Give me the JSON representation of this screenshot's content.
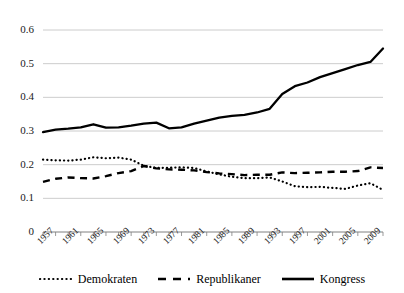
{
  "chart_data": {
    "type": "line",
    "title": "",
    "subtitle": "",
    "xlabel": "",
    "ylabel": "",
    "grid": true,
    "legend_position": "bottom",
    "xlim": [
      1957,
      2011
    ],
    "ylim": [
      0,
      0.6
    ],
    "yticks": [
      "0",
      "0.1",
      "0.2",
      "0.3",
      "0.4",
      "0.5",
      "0.6"
    ],
    "ytick_values": [
      0,
      0.1,
      0.2,
      0.3,
      0.4,
      0.5,
      0.6
    ],
    "xticks": [
      "1957",
      "1961",
      "1965",
      "1969",
      "1973",
      "1977",
      "1981",
      "1985",
      "1989",
      "1993",
      "1997",
      "2001",
      "2005",
      "2009"
    ],
    "x": [
      1957,
      1959,
      1961,
      1963,
      1965,
      1967,
      1969,
      1971,
      1973,
      1975,
      1977,
      1979,
      1981,
      1983,
      1985,
      1987,
      1989,
      1991,
      1993,
      1995,
      1997,
      1999,
      2001,
      2003,
      2005,
      2007,
      2009,
      2011
    ],
    "series": [
      {
        "name": "Demokraten",
        "style": "dotted",
        "color": "#000000",
        "values": [
          0.215,
          0.213,
          0.212,
          0.215,
          0.222,
          0.219,
          0.221,
          0.215,
          0.197,
          0.19,
          0.191,
          0.192,
          0.19,
          0.18,
          0.171,
          0.164,
          0.16,
          0.16,
          0.162,
          0.15,
          0.136,
          0.133,
          0.134,
          0.131,
          0.128,
          0.138,
          0.145,
          0.125
        ]
      },
      {
        "name": "Republikaner",
        "style": "dashed",
        "color": "#000000",
        "values": [
          0.149,
          0.158,
          0.162,
          0.16,
          0.159,
          0.166,
          0.175,
          0.181,
          0.196,
          0.189,
          0.186,
          0.185,
          0.183,
          0.178,
          0.174,
          0.172,
          0.169,
          0.17,
          0.17,
          0.177,
          0.175,
          0.176,
          0.177,
          0.179,
          0.179,
          0.181,
          0.192,
          0.19
        ]
      },
      {
        "name": "Kongress",
        "style": "solid",
        "color": "#000000",
        "values": [
          0.297,
          0.304,
          0.307,
          0.311,
          0.32,
          0.31,
          0.311,
          0.316,
          0.322,
          0.325,
          0.308,
          0.311,
          0.322,
          0.331,
          0.34,
          0.345,
          0.348,
          0.355,
          0.366,
          0.41,
          0.433,
          0.444,
          0.46,
          0.472,
          0.484,
          0.496,
          0.505,
          0.545
        ]
      }
    ]
  },
  "legend": {
    "items": [
      {
        "label": "Demokraten",
        "style": "dotted"
      },
      {
        "label": "Republikaner",
        "style": "dashed"
      },
      {
        "label": "Kongress",
        "style": "solid"
      }
    ]
  },
  "axes": {
    "gridline_color": "#bfbfbf",
    "axis_color": "#808080"
  }
}
